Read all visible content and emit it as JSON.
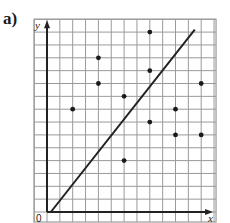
{
  "part_label": "a)",
  "chart_data": {
    "type": "scatter",
    "title": "",
    "xlabel": "x",
    "ylabel": "y",
    "origin_label": "0",
    "grid": true,
    "xlim": [
      -1,
      13
    ],
    "ylim": [
      0,
      15
    ],
    "points": [
      {
        "x": 2,
        "y": 8
      },
      {
        "x": 4,
        "y": 12
      },
      {
        "x": 4,
        "y": 10
      },
      {
        "x": 6,
        "y": 9
      },
      {
        "x": 6,
        "y": 4
      },
      {
        "x": 8,
        "y": 14
      },
      {
        "x": 8,
        "y": 11
      },
      {
        "x": 8,
        "y": 7
      },
      {
        "x": 10,
        "y": 8
      },
      {
        "x": 10,
        "y": 6
      },
      {
        "x": 12,
        "y": 10
      },
      {
        "x": 12,
        "y": 6
      }
    ],
    "line": {
      "x1": 0.3,
      "y1": 0,
      "x2": 11.5,
      "y2": 14.2
    }
  },
  "colors": {
    "grid": "#9a9a9a",
    "axis": "#222222",
    "point": "#1a1a1a",
    "line": "#222222"
  }
}
